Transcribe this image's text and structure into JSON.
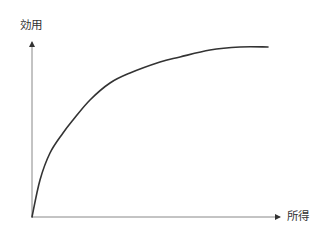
{
  "chart_data": {
    "type": "line",
    "title": "",
    "xlabel": "所得",
    "ylabel": "効用",
    "grid": false,
    "legend": null,
    "ticks": false,
    "x": [
      0,
      8,
      18,
      31,
      41,
      58,
      78,
      98,
      128,
      148,
      178,
      208,
      236
    ],
    "values": [
      0,
      37,
      64,
      84,
      97,
      117,
      134,
      144,
      155,
      160,
      167,
      170,
      170
    ],
    "axis_origin_px": [
      32,
      217
    ],
    "colors": {
      "axis": "#888888",
      "curve": "#333333",
      "text": "#333333"
    }
  },
  "labels": {
    "y_axis": "効用",
    "x_axis": "所得"
  }
}
